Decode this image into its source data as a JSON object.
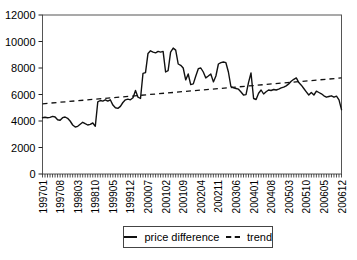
{
  "chart_data": {
    "type": "line",
    "title": "",
    "x_axis": {
      "unit": "year-month (YYYYMM)",
      "start": "199701",
      "end": "200612",
      "n_points": 120,
      "tick_step_months": 7,
      "tick_labels": [
        "199701",
        "199708",
        "199803",
        "199810",
        "199905",
        "199912",
        "200007",
        "200102",
        "200109",
        "200204",
        "200211",
        "200306",
        "200401",
        "200408",
        "200503",
        "200510",
        "200605",
        "200612"
      ]
    },
    "y_axis": {
      "min": 0,
      "max": 12000,
      "ticks": [
        0,
        2000,
        4000,
        6000,
        8000,
        10000,
        12000
      ]
    },
    "series": [
      {
        "name": "price difference",
        "line_style": "solid",
        "values": [
          4250,
          4280,
          4250,
          4270,
          4350,
          4300,
          4100,
          4050,
          4250,
          4300,
          4200,
          4000,
          3700,
          3550,
          3600,
          3750,
          3900,
          3800,
          3700,
          3750,
          3850,
          3600,
          5450,
          5550,
          5500,
          5600,
          5500,
          5600,
          5200,
          5000,
          4950,
          5100,
          5400,
          5600,
          5650,
          5600,
          5750,
          6300,
          5800,
          5700,
          7600,
          7650,
          9100,
          9300,
          9200,
          9150,
          9250,
          9200,
          9250,
          7700,
          7800,
          9200,
          9500,
          9350,
          8300,
          8200,
          8000,
          7100,
          7550,
          6750,
          6800,
          7400,
          7950,
          8000,
          7700,
          7250,
          7400,
          7550,
          6950,
          7400,
          8300,
          8400,
          8450,
          8400,
          7700,
          6600,
          6500,
          6450,
          6400,
          6190,
          5960,
          5990,
          6900,
          7620,
          5700,
          5620,
          6100,
          6340,
          6040,
          6200,
          6340,
          6300,
          6380,
          6340,
          6410,
          6500,
          6550,
          6650,
          6800,
          7000,
          7150,
          7250,
          6900,
          6700,
          6450,
          6200,
          5960,
          6150,
          5960,
          6250,
          6150,
          6050,
          5900,
          5800,
          5850,
          5900,
          5800,
          5870,
          5600,
          4850
        ]
      },
      {
        "name": "trend",
        "line_style": "dashed",
        "endpoints": [
          5300,
          7250
        ]
      }
    ],
    "legend": {
      "position": "bottom-center",
      "entries": [
        "price difference",
        "trend"
      ]
    },
    "grid": false,
    "colors": {
      "price_difference_line": "#111111",
      "trend_line": "#111111",
      "axis": "#555555",
      "tick": "#222222",
      "text": "#000000",
      "background": "#ffffff"
    }
  }
}
